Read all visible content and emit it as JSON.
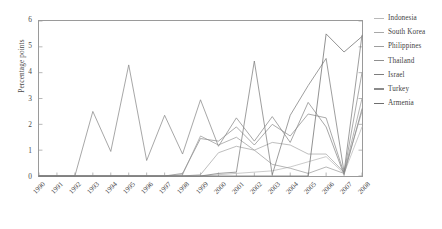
{
  "chart_data": {
    "type": "line",
    "title": "",
    "xlabel": "",
    "ylabel": "Percentage points",
    "ylim": [
      0,
      6
    ],
    "yticks": [
      0,
      1,
      2,
      3,
      4,
      5,
      6
    ],
    "grid": false,
    "legend_position": "right",
    "x": [
      1990,
      1991,
      1992,
      1993,
      1994,
      1995,
      1996,
      1997,
      1998,
      1999,
      2000,
      2001,
      2002,
      2003,
      2004,
      2005,
      2006,
      2007,
      2008
    ],
    "series": [
      {
        "name": "Indonesia",
        "color": "#b9b9b9",
        "values": [
          0,
          0,
          0,
          0,
          0,
          0,
          0,
          0,
          0,
          0,
          0.05,
          0.1,
          0.15,
          0.2,
          0.35,
          0.55,
          0.75,
          0.1,
          1.9
        ]
      },
      {
        "name": "South Korea",
        "color": "#a8a8a8",
        "values": [
          0,
          0,
          0,
          0,
          0,
          0,
          0,
          0,
          0,
          0.05,
          0.9,
          1.15,
          1.0,
          1.3,
          1.2,
          0.85,
          0.85,
          0.15,
          2.5
        ]
      },
      {
        "name": "Philippines",
        "color": "#9e9e9e",
        "values": [
          0,
          0,
          0,
          0,
          0,
          0,
          0,
          0,
          0.05,
          1.55,
          1.2,
          1.5,
          1.0,
          0.45,
          0.3,
          0.1,
          0.35,
          0.1,
          3.0
        ]
      },
      {
        "name": "Thailand",
        "color": "#8f8f8f",
        "values": [
          0,
          0,
          0,
          0,
          0,
          0,
          0,
          0,
          0.1,
          1.45,
          1.35,
          1.9,
          1.2,
          2.0,
          1.55,
          2.4,
          2.25,
          0.1,
          4.0
        ]
      },
      {
        "name": "Israel",
        "color": "#7d7d7d",
        "values": [
          0,
          0,
          0,
          0,
          0,
          0,
          0,
          0,
          0,
          0,
          0.1,
          0.15,
          4.45,
          0.05,
          2.35,
          3.5,
          4.55,
          0.15,
          5.45
        ]
      },
      {
        "name": "Turkey",
        "color": "#8a8a8a",
        "values": [
          0,
          0,
          0,
          2.5,
          0.95,
          4.3,
          0.6,
          2.35,
          0.85,
          2.95,
          1.15,
          2.25,
          1.35,
          2.3,
          1.3,
          2.85,
          1.9,
          0.05,
          2.6
        ]
      },
      {
        "name": "Armenia",
        "color": "#6e6e6e",
        "values": [
          0,
          0,
          0,
          0,
          0,
          0,
          0,
          0,
          0,
          0,
          0,
          0,
          0,
          0,
          0,
          0,
          5.5,
          4.8,
          5.4
        ]
      }
    ]
  },
  "axis": {
    "y_title": "Percentage points",
    "y_tick_labels": [
      "0",
      "1",
      "2",
      "3",
      "4",
      "5",
      "6"
    ],
    "x_tick_labels": [
      "1990",
      "1991",
      "1992",
      "1993",
      "1994",
      "1995",
      "1996",
      "1997",
      "1998",
      "1999",
      "2000",
      "2001",
      "2002",
      "2003",
      "2004",
      "2005",
      "2006",
      "2007",
      "2008"
    ]
  },
  "legend": {
    "entries": [
      {
        "label": "Indonesia",
        "color": "#b9b9b9"
      },
      {
        "label": "South Korea",
        "color": "#a8a8a8"
      },
      {
        "label": "Philippines",
        "color": "#9e9e9e"
      },
      {
        "label": "Thailand",
        "color": "#8f8f8f"
      },
      {
        "label": "Israel",
        "color": "#7d7d7d"
      },
      {
        "label": "Turkey",
        "color": "#8a8a8a"
      },
      {
        "label": "Armenia",
        "color": "#6e6e6e"
      }
    ]
  }
}
